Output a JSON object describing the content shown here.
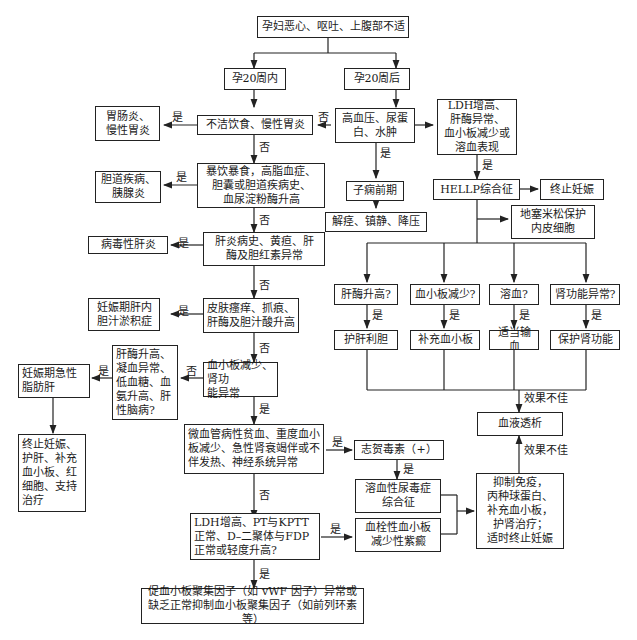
{
  "title_fragment": "",
  "nodes": {
    "start": "孕妇恶心、呕吐、上腹部不适",
    "within20": "孕20周内",
    "after20": "孕20周后",
    "unclean_food": "不洁饮食、慢性胃炎",
    "gastroenteritis": "胃肠炎、\n慢性胃炎",
    "htn": "高血压、尿蛋\n白、水肿",
    "ldh_high": "LDH增高、\n肝酶异常、\n血小板减少或\n溶血表现",
    "binge": "暴饮暴食，高脂血症、\n胆囊或胆道疾病史、\n血尿淀粉酶升高",
    "biliary": "胆道疾病、\n胰腺炎",
    "preeclampsia": "子痫前期",
    "preeclampsia_tx": "解痉、镇静、降压",
    "hellp": "HELLP综合征",
    "terminate1": "终止妊娠",
    "dexamethasone": "地塞米松保护\n内皮细胞",
    "hepatitis_hx": "肝炎病史、黄疸、肝\n酶及胆红素异常",
    "viral_hepatitis": "病毒性肝炎",
    "liver_enzyme_q": "肝酶升高?",
    "platelet_q": "血小板减少?",
    "hemolysis_q": "溶血?",
    "renal_q": "肾功能异常?",
    "liver_tx": "护肝利胆",
    "platelet_tx": "补充血小板",
    "transfusion_tx": "适当输血",
    "renal_tx": "保护肾功能",
    "pruritus": "皮肤瘙痒、抓痕、\n肝酶及胆汁酸升高",
    "icp": "妊娠期肝内\n胆汁淤积症",
    "plt_renal": "血小板减少、肾功\n能异常",
    "afl_criteria": "肝酶升高、\n凝血异常、\n低血糖、血\n氨升高、肝\n性脑病?",
    "afl": "妊娠期急性\n脂肪肝",
    "afl_tx": "终止妊娠、\n护肝、补充\n血小板、红\n细胞、支持\n治疗",
    "dialysis": "血液透析",
    "mahat": "微血管病性贫血、重度血小\n板减少、急性肾衰竭伴或不\n伴发热、神经系统异常",
    "shiga": "志贺毒素（+）",
    "hus": "溶血性尿毒症\n综合征",
    "immuno_tx": "抑制免疫，\n丙种球蛋白、\n补充血小板，\n护肾治疗；\n适时终止妊娠",
    "ldh_pt": "LDH增高、PT与KPTT\n正常、D–二聚体与FDP\n正常或轻度升高?",
    "ttp": "血栓性血小板\n减少性紫癜",
    "vwf": "促血小板聚集因子（如 vWF 因子）异常或\n缺乏正常抑制血小板聚集因子（如前列环素等）"
  },
  "edge_labels": {
    "yes": "是",
    "no": "否",
    "poor_effect": "效果不佳"
  }
}
